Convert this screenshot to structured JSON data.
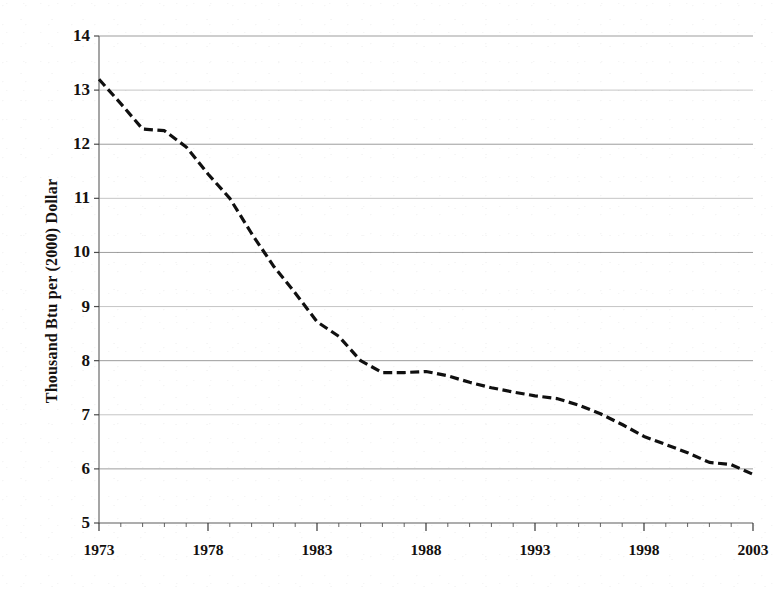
{
  "chart_data": {
    "type": "line",
    "title": "",
    "xlabel": "",
    "ylabel": "Thousand Btu per (2000) Dollar",
    "xlim": [
      1973,
      2003
    ],
    "ylim": [
      5,
      14
    ],
    "yticks": [
      5,
      6,
      7,
      8,
      9,
      10,
      11,
      12,
      13,
      14
    ],
    "ytick_labels": [
      "5",
      "6",
      "7",
      "8",
      "9",
      "10",
      "11",
      "12",
      "13",
      "14"
    ],
    "xticks": [
      1973,
      1978,
      1983,
      1988,
      1993,
      1998,
      2003
    ],
    "xtick_labels": [
      "1973",
      "1978",
      "1983",
      "1988",
      "1993",
      "1998",
      "2003"
    ],
    "x_minor_ticks": [
      1974,
      1975,
      1976,
      1977,
      1979,
      1980,
      1981,
      1982,
      1984,
      1985,
      1986,
      1987,
      1989,
      1990,
      1991,
      1992,
      1994,
      1995,
      1996,
      1997,
      1999,
      2000,
      2001,
      2002
    ],
    "grid": true,
    "grid_axis": "y",
    "legend": null,
    "line_style": "dashed",
    "line_color": "#101010",
    "series": [
      {
        "name": "Energy intensity",
        "x": [
          1973,
          1974,
          1975,
          1976,
          1977,
          1978,
          1979,
          1980,
          1981,
          1982,
          1983,
          1984,
          1985,
          1986,
          1987,
          1988,
          1989,
          1990,
          1991,
          1992,
          1993,
          1994,
          1995,
          1996,
          1997,
          1998,
          1999,
          2000,
          2001,
          2002,
          2003
        ],
        "values": [
          13.2,
          12.75,
          12.28,
          12.25,
          11.95,
          11.45,
          11.0,
          10.35,
          9.75,
          9.25,
          8.72,
          8.45,
          8.0,
          7.78,
          7.78,
          7.8,
          7.72,
          7.6,
          7.5,
          7.42,
          7.35,
          7.3,
          7.18,
          7.02,
          6.82,
          6.6,
          6.45,
          6.3,
          6.12,
          6.08,
          5.9
        ]
      }
    ]
  },
  "axis": {
    "ylabel_text": "Thousand Btu per (2000) Dollar"
  }
}
